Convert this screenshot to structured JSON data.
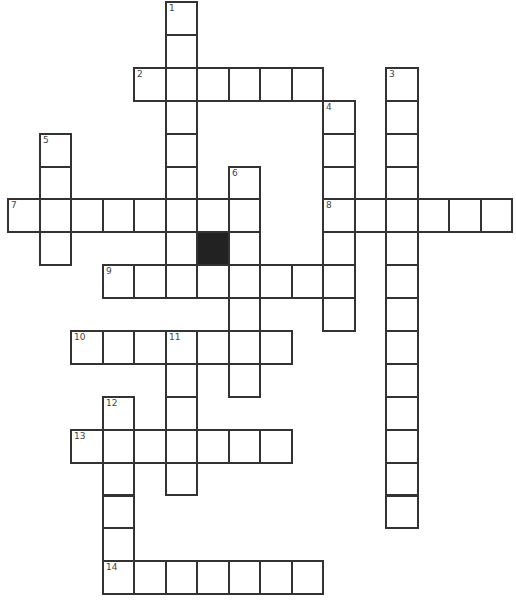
{
  "puzzle": {
    "type": "crossword",
    "cell_width": 31.5,
    "cell_height": 32.9,
    "origin_x": 7,
    "origin_y": 1,
    "colors": {
      "border": "#333333",
      "fill": "#ffffff",
      "block": "#222222",
      "number": "#444444"
    }
  },
  "entries": [
    {
      "number": "1",
      "direction": "down",
      "row": 0,
      "col": 5,
      "length": 9
    },
    {
      "number": "2",
      "direction": "across",
      "row": 2,
      "col": 4,
      "length": 6
    },
    {
      "number": "3",
      "direction": "down",
      "row": 2,
      "col": 12,
      "length": 14
    },
    {
      "number": "4",
      "direction": "down",
      "row": 3,
      "col": 10,
      "length": 7
    },
    {
      "number": "5",
      "direction": "down",
      "row": 4,
      "col": 1,
      "length": 4
    },
    {
      "number": "6",
      "direction": "down",
      "row": 5,
      "col": 7,
      "length": 7
    },
    {
      "number": "7",
      "direction": "across",
      "row": 6,
      "col": 0,
      "length": 8
    },
    {
      "number": "8",
      "direction": "across",
      "row": 6,
      "col": 10,
      "length": 6
    },
    {
      "number": "9",
      "direction": "across",
      "row": 8,
      "col": 3,
      "length": 8
    },
    {
      "number": "10",
      "direction": "across",
      "row": 10,
      "col": 2,
      "length": 7
    },
    {
      "number": "11",
      "direction": "down",
      "row": 10,
      "col": 5,
      "length": 5
    },
    {
      "number": "12",
      "direction": "down",
      "row": 12,
      "col": 3,
      "length": 6
    },
    {
      "number": "13",
      "direction": "across",
      "row": 13,
      "col": 2,
      "length": 7
    },
    {
      "number": "14",
      "direction": "across",
      "row": 17,
      "col": 3,
      "length": 7
    }
  ],
  "blocks": [
    {
      "row": 7,
      "col": 6
    }
  ]
}
